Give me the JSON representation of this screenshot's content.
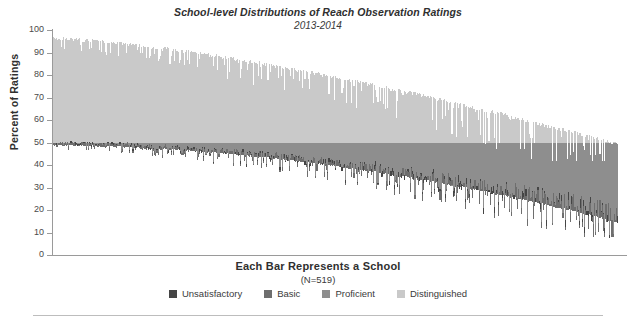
{
  "chart_data": {
    "type": "bar",
    "subtype": "stacked-bar-100-percent",
    "title": "School-level Distributions of Reach Observation Ratings",
    "subtitle": "2013-2014",
    "xlabel": "Each Bar Represents a School",
    "xlabel_note": "(N=519)",
    "ylabel": "Percent of Ratings",
    "ylim": [
      0,
      100
    ],
    "yticks": [
      0,
      10,
      20,
      30,
      40,
      50,
      60,
      70,
      80,
      90,
      100
    ],
    "ytick_labels": [
      "0",
      "10",
      "20",
      "30",
      "40",
      "50",
      "60",
      "70",
      "80",
      "90",
      "100"
    ],
    "grid": false,
    "legend_position": "bottom",
    "n_bars": 519,
    "sorted_by": "descending share of Distinguished",
    "series": [
      {
        "name": "Unsatisfactory",
        "color": "#454545",
        "description": "Thinnest segment, plotted at the bottom of each bar; typically 0-2% of ratings, rising to a few percent among the right-most schools.",
        "approx_mean_percent": 1
      },
      {
        "name": "Basic",
        "color": "#6e6e6e",
        "description": "Second segment from the bottom; near 0-3% for most schools on the left and growing toward 15-30% for the right-most schools.",
        "approx_mean_percent": 5
      },
      {
        "name": "Proficient",
        "color": "#8e8e8e",
        "description": "Middle segment occupying roughly the band from 48% up to 50% of the scale for left-hand schools and widening downward toward the right.",
        "approx_mean_percent": 45
      },
      {
        "name": "Distinguished",
        "color": "#c9c9c9",
        "description": "Largest, top segment. Reaches about 97% of ratings at the left-most school and declines steadily to roughly 50% at the right edge.",
        "approx_mean_percent": 49
      }
    ],
    "envelope": {
      "note": "Per-bar cumulative top value (Distinguished share of the stack read from the top of the axis) and the bottom edge of the colored stack, expressed in percent.",
      "distinguished_top_percent_start": 97,
      "distinguished_top_percent_end": 50,
      "stack_bottom_percent_start": 49,
      "stack_bottom_percent_end": 15
    }
  },
  "legend": {
    "items": [
      {
        "label": "Unsatisfactory",
        "color": "#454545"
      },
      {
        "label": "Basic",
        "color": "#6e6e6e"
      },
      {
        "label": "Proficient",
        "color": "#8e8e8e"
      },
      {
        "label": "Distinguished",
        "color": "#c9c9c9"
      }
    ]
  },
  "axis": {
    "y_title": "Percent of Ratings",
    "ticks": [
      "100",
      "90",
      "80",
      "70",
      "60",
      "50",
      "40",
      "30",
      "20",
      "10",
      "0"
    ]
  },
  "colors": {
    "axis": "#9a9a9a",
    "text": "#3a3a3a",
    "rule": "#bdbdbd",
    "background": "#ffffff"
  }
}
